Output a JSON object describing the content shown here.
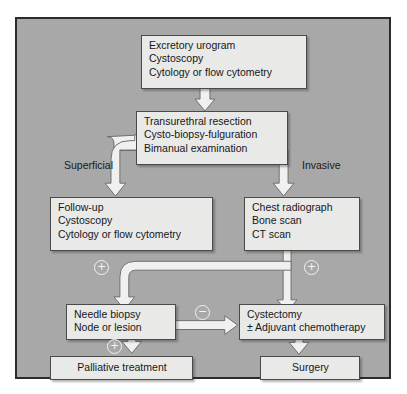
{
  "figure": {
    "background_color": "#a8a8a8",
    "box_color": "#e9e9e7",
    "border_color": "#2b2b2b"
  },
  "nodes": {
    "workup": {
      "name": "initial-workup",
      "lines": [
        "Excretory urogram",
        "Cystoscopy",
        "Cytology or flow cytometry"
      ]
    },
    "resection": {
      "name": "transurethral-resection",
      "lines": [
        "Transurethral resection",
        "Cysto-biopsy-fulguration",
        "Bimanual examination"
      ]
    },
    "followup": {
      "name": "follow-up",
      "lines": [
        "Follow-up",
        "Cystoscopy",
        "Cytology or flow cytometry"
      ]
    },
    "staging": {
      "name": "staging-imaging",
      "lines": [
        "Chest radiograph",
        "Bone scan",
        "CT scan"
      ]
    },
    "needle": {
      "name": "needle-biopsy",
      "lines": [
        "Needle biopsy",
        "Node or lesion"
      ]
    },
    "cystectomy": {
      "name": "cystectomy",
      "lines": [
        "Cystectomy",
        "± Adjuvant chemotherapy"
      ]
    },
    "palliative": {
      "name": "palliative-treatment",
      "lines": [
        "Palliative treatment"
      ]
    },
    "surgery": {
      "name": "surgery",
      "lines": [
        "Surgery"
      ]
    }
  },
  "branch_labels": {
    "left": "Superficial",
    "right": "Invasive"
  },
  "signs": {
    "plus_left": "+",
    "plus_right": "+",
    "minus_middle": "−",
    "plus_bottom": "+"
  }
}
